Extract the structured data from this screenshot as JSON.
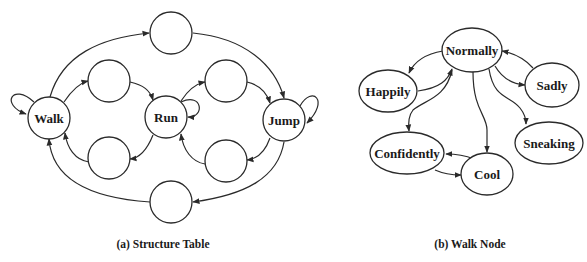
{
  "diagram_a": {
    "caption": "(a) Structure Table",
    "nodes": {
      "walk": "Walk",
      "run": "Run",
      "jump": "Jump",
      "top": "",
      "bottom": "",
      "upper_left": "",
      "upper_right": "",
      "lower_left": "",
      "lower_right": ""
    },
    "edges": [
      {
        "from": "Walk",
        "to": "Walk",
        "type": "self-loop"
      },
      {
        "from": "Run",
        "to": "Run",
        "type": "self-loop"
      },
      {
        "from": "Jump",
        "to": "Jump",
        "type": "self-loop"
      },
      {
        "from": "Walk",
        "to": "top"
      },
      {
        "from": "top",
        "to": "Jump"
      },
      {
        "from": "Jump",
        "to": "bottom"
      },
      {
        "from": "bottom",
        "to": "Walk"
      },
      {
        "from": "Walk",
        "to": "upper_left"
      },
      {
        "from": "upper_left",
        "to": "Run"
      },
      {
        "from": "Run",
        "to": "lower_left"
      },
      {
        "from": "lower_left",
        "to": "Walk"
      },
      {
        "from": "Run",
        "to": "upper_right"
      },
      {
        "from": "upper_right",
        "to": "Jump"
      },
      {
        "from": "Jump",
        "to": "lower_right"
      },
      {
        "from": "lower_right",
        "to": "Run"
      }
    ]
  },
  "diagram_b": {
    "caption": "(b) Walk Node",
    "nodes": {
      "normally": "Normally",
      "happily": "Happily",
      "sadly": "Sadly",
      "sneaking": "Sneaking",
      "confidently": "Confidently",
      "cool": "Cool"
    },
    "edges": [
      {
        "from": "Normally",
        "to": "Happily"
      },
      {
        "from": "Happily",
        "to": "Normally"
      },
      {
        "from": "Sadly",
        "to": "Normally"
      },
      {
        "from": "Normally",
        "to": "Sadly"
      },
      {
        "from": "Normally",
        "to": "Sneaking"
      },
      {
        "from": "Normally",
        "to": "Cool"
      },
      {
        "from": "Normally",
        "to": "Confidently"
      },
      {
        "from": "Cool",
        "to": "Confidently"
      },
      {
        "from": "Confidently",
        "to": "Cool"
      }
    ]
  },
  "colors": {
    "stroke": "#2a2a2a",
    "text": "#1a1a1a",
    "background": "#ffffff"
  }
}
